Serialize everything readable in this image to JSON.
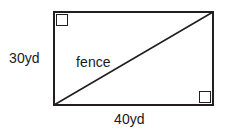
{
  "diagram": {
    "type": "right-triangle-in-rectangle",
    "shape": {
      "name": "rectangle",
      "width_label": "40yd",
      "height_label": "30yd",
      "diagonal_label": "fence"
    },
    "labels": {
      "height": "30yd",
      "diagonal": "fence",
      "width": "40yd"
    },
    "markers": {
      "top_left": "right-angle-square",
      "bottom_right": "right-angle-square"
    },
    "colors": {
      "stroke": "#231f20",
      "text": "#1a1a1a",
      "background": "#ffffff"
    },
    "geometry": {
      "rect_left": 53,
      "rect_top": 11,
      "rect_width": 161,
      "rect_height": 95,
      "diagonal_from": "bottom-left",
      "diagonal_to": "top-right"
    }
  }
}
